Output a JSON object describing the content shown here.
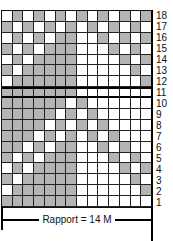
{
  "chart": {
    "columns": 14,
    "rows": 18,
    "colors": {
      "filled": "#b4b4b4",
      "empty": "#ffffff",
      "grid": "#222222"
    },
    "row_labels": [
      "18",
      "17",
      "16",
      "15",
      "14",
      "13",
      "12",
      "11",
      "10",
      "9",
      "8",
      "7",
      "6",
      "5",
      "4",
      "3",
      "2",
      "1"
    ],
    "grid_top_to_bottom": [
      "WGWGWGWGWGWGWG",
      "GWGWGWGWGWGWGW",
      "WGWGWGGWWGWGWG",
      "GWGWGGGWWWGWGW",
      "WGWGGGGWWWWGWG",
      "GWGGGGGWWWWWGW",
      "WGGGGGGWWWWWWG",
      "GGGGGGGWWWWWWW",
      "GGGGGGWGWWWWWW",
      "GGGGGWGWGWWWWW",
      "GGGGWGWGWGWWWW",
      "GGGWGWGWGWGWWW",
      "GGWGWGGWWGWGWW",
      "GWGWGGGWWWGWGW",
      "WGWGGGGWWWWGWG",
      "GWGGGGGWWWWWGW",
      "WGGGGGGWWWWWWG",
      "GGGGGGGWWWWWWW"
    ]
  },
  "rapport": {
    "label": "Rapport = 14 M"
  }
}
